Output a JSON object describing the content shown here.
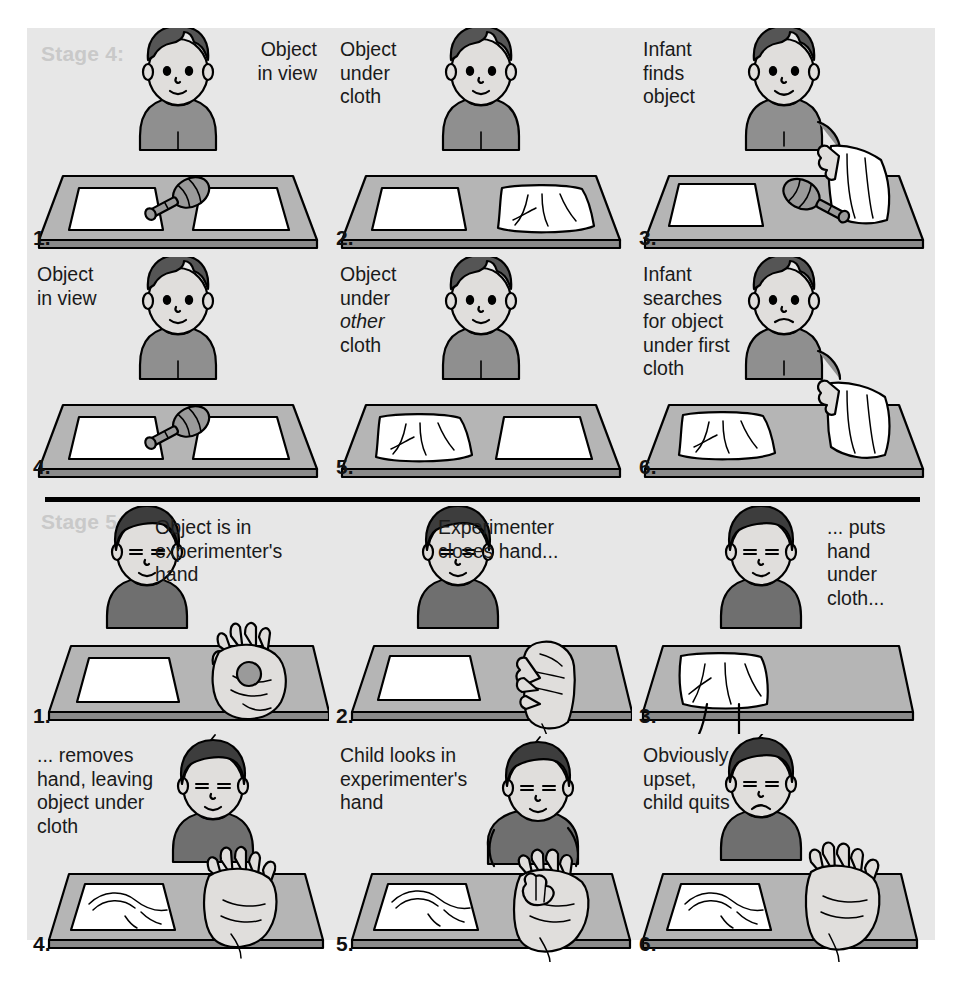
{
  "figure": {
    "background_color": "#ffffff",
    "panel_color": "#e7e7e7",
    "stage_label_color": "#c9c9c9",
    "caption_color": "#1a1a1a"
  },
  "stages": [
    {
      "id": "stage-4",
      "label": "Stage 4:",
      "panels": [
        {
          "number": "1.",
          "caption_lines": [
            "Object",
            "in view"
          ],
          "caption_align": "right"
        },
        {
          "number": "2.",
          "caption_lines": [
            "Object",
            "under",
            "cloth"
          ],
          "caption_align": "left"
        },
        {
          "number": "3.",
          "caption_lines": [
            "Infant",
            "finds",
            "object"
          ],
          "caption_align": "left"
        },
        {
          "number": "4.",
          "caption_lines": [
            "Object",
            "in view"
          ],
          "caption_align": "left"
        },
        {
          "number": "5.",
          "caption_lines": [
            "Object",
            "under",
            "other",
            "cloth"
          ],
          "caption_align": "left",
          "italic_line": 2
        },
        {
          "number": "6.",
          "caption_lines": [
            "Infant",
            "searches",
            "for object",
            "under first",
            "cloth"
          ],
          "caption_align": "left"
        }
      ]
    },
    {
      "id": "stage-5",
      "label": "Stage 5:",
      "panels": [
        {
          "number": "1.",
          "caption_lines": [
            "Object is in",
            "experimenter's",
            "hand"
          ],
          "caption_align": "left"
        },
        {
          "number": "2.",
          "caption_lines": [
            "Experimenter",
            "closes hand..."
          ],
          "caption_align": "left"
        },
        {
          "number": "3.",
          "caption_lines": [
            "... puts",
            "hand",
            "under",
            "cloth..."
          ],
          "caption_align": "left"
        },
        {
          "number": "4.",
          "caption_lines": [
            "... removes",
            "hand, leaving",
            "object under",
            "cloth"
          ],
          "caption_align": "left"
        },
        {
          "number": "5.",
          "caption_lines": [
            "Child looks in",
            "experimenter's",
            "hand"
          ],
          "caption_align": "left"
        },
        {
          "number": "6.",
          "caption_lines": [
            "Obviously",
            "upset,",
            "child quits"
          ],
          "caption_align": "left"
        }
      ]
    }
  ],
  "captions": {
    "s4p1": "Object\nin view",
    "s4p2": "Object\nunder\ncloth",
    "s4p3": "Infant\nfinds\nobject",
    "s4p4": "Object\nin view",
    "s4p5_a": "Object\nunder\n",
    "s4p5_b": "other",
    "s4p5_c": "\ncloth",
    "s4p6": "Infant\nsearches\nfor object\nunder first\ncloth",
    "s5p1": "Object is in\nexperimenter's\nhand",
    "s5p2": "Experimenter\ncloses hand...",
    "s5p3": "... puts\nhand\nunder\ncloth...",
    "s5p4": "... removes\nhand, leaving\nobject under\ncloth",
    "s5p5": "Child looks in\nexperimenter's\nhand",
    "s5p6": "Obviously\nupset,\nchild quits"
  },
  "numbers": {
    "s4p1": "1.",
    "s4p2": "2.",
    "s4p3": "3.",
    "s4p4": "4.",
    "s4p5": "5.",
    "s4p6": "6.",
    "s5p1": "1.",
    "s5p2": "2.",
    "s5p3": "3.",
    "s5p4": "4.",
    "s5p5": "5.",
    "s5p6": "6."
  },
  "labels": {
    "stage4": "Stage 4:",
    "stage5": "Stage 5:"
  },
  "colors": {
    "skin": "#e0dedc",
    "skin_shade": "#c9c7c5",
    "hair": "#555555",
    "shirt": "#8f8f8f",
    "shirt_dark": "#6f6f6f",
    "table_top": "#b5b5b5",
    "table_edge": "#8a8a8a",
    "cloth": "#ffffff",
    "rattle": "#9a9a9a",
    "ball": "#9a9a9a",
    "outline": "#000000"
  },
  "scene_elements": {
    "infant": "seated-infant",
    "table": "trapezoid-table",
    "cloth_flat": "white-cloth-flat",
    "cloth_crumpled": "white-cloth-crumpled",
    "rattle": "rattle-toy",
    "ball": "small-ball",
    "hand_open": "open-hand",
    "hand_closed": "closed-fist"
  }
}
